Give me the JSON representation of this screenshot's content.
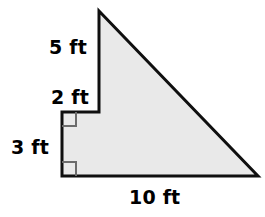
{
  "figure": {
    "kind": "stepped-right-triangle",
    "fill_color": "#e9e9e9",
    "stroke_color": "#0f0f0f",
    "background_color": "#ffffff",
    "right_angle_marker_color": "#6b6b6b",
    "outline_width": 3,
    "vertices": [
      {
        "name": "apex-top",
        "x": 99,
        "y": 11
      },
      {
        "name": "bottom-right",
        "x": 258,
        "y": 176
      },
      {
        "name": "bottom-left",
        "x": 62,
        "y": 176
      },
      {
        "name": "notch-outer-corner",
        "x": 62,
        "y": 112
      },
      {
        "name": "notch-inner-corner",
        "x": 99,
        "y": 112
      }
    ],
    "right_angle_markers": [
      {
        "name": "right-angle-notch",
        "x": 62,
        "y": 112,
        "size": 14,
        "dir_x": 1,
        "dir_y": 1
      },
      {
        "name": "right-angle-bottom-left",
        "x": 62,
        "y": 176,
        "size": 14,
        "dir_x": 1,
        "dir_y": -1
      }
    ]
  },
  "labels": {
    "side_top_left": "5 ft",
    "side_notch_riser": "2 ft",
    "side_left": "3 ft",
    "side_bottom": "10 ft"
  },
  "measurements": [
    {
      "label": "5 ft",
      "value": 5,
      "unit": "ft",
      "edge": "upper vertical segment"
    },
    {
      "label": "2 ft",
      "value": 2,
      "unit": "ft",
      "edge": "lower vertical segment of notch riser"
    },
    {
      "label": "3 ft",
      "value": 3,
      "unit": "ft",
      "edge": "left vertical side"
    },
    {
      "label": "10 ft",
      "value": 10,
      "unit": "ft",
      "edge": "bottom horizontal side"
    }
  ]
}
